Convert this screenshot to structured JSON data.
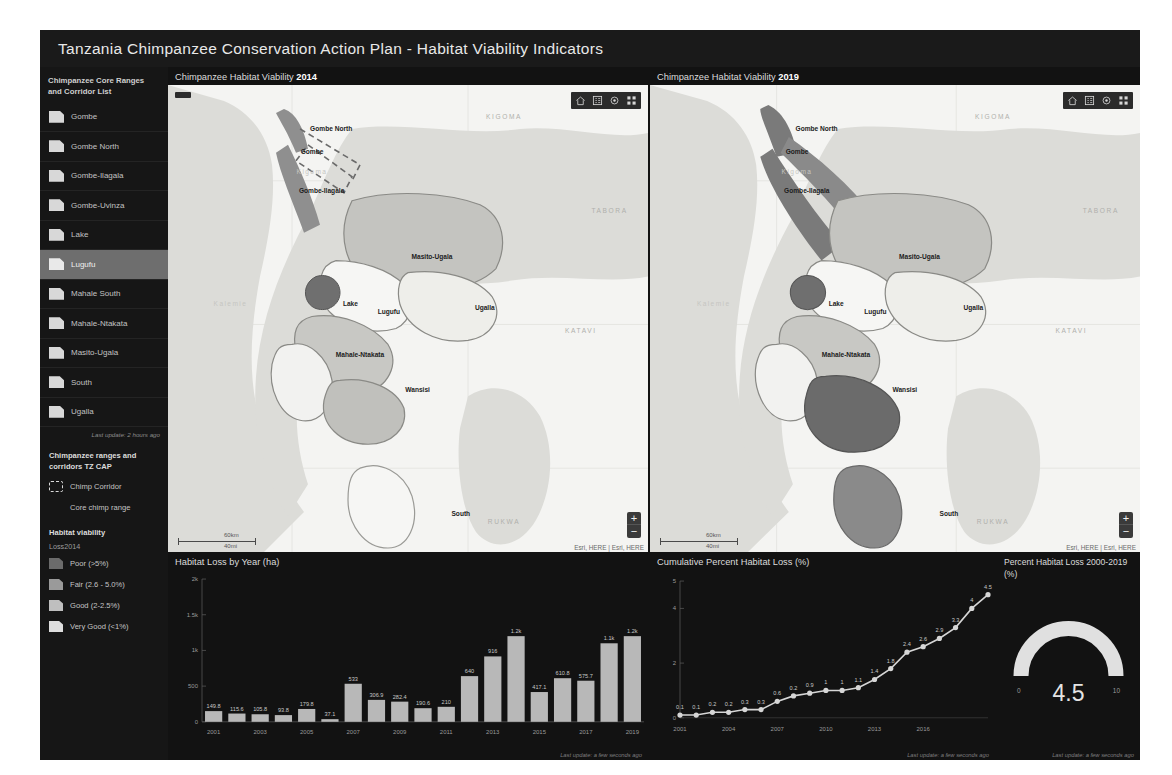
{
  "header": {
    "title": "Tanzania Chimpanzee Conservation Action Plan - Habitat Viability Indicators"
  },
  "sidebar": {
    "list_heading": "Chimpanzee Core Ranges and Corridor List",
    "items": [
      {
        "label": "Gombe",
        "selected": false
      },
      {
        "label": "Gombe North",
        "selected": false
      },
      {
        "label": "Gombe-Ilagala",
        "selected": false
      },
      {
        "label": "Gombe-Uvinza",
        "selected": false
      },
      {
        "label": "Lake",
        "selected": false
      },
      {
        "label": "Lugufu",
        "selected": true
      },
      {
        "label": "Mahale South",
        "selected": false
      },
      {
        "label": "Mahale-Ntakata",
        "selected": false
      },
      {
        "label": "Masito-Ugala",
        "selected": false
      },
      {
        "label": "South",
        "selected": false
      },
      {
        "label": "Ugalla",
        "selected": false
      }
    ],
    "list_update": "Last update: 2 hours ago",
    "legend_heading": "Chimpanzee ranges and corridors TZ CAP",
    "corridor_label": "Chimp Corridor",
    "core_range_label": "Core chimp range",
    "viability_heading": "Habitat viability",
    "viability_sub": "Loss2014",
    "viability_classes": [
      {
        "label": "Poor (>5%)",
        "color": "#6b6b6b"
      },
      {
        "label": "Fair (2.6 - 5.0%)",
        "color": "#9a9a9a"
      },
      {
        "label": "Good (2-2.5%)",
        "color": "#bfbfbf"
      },
      {
        "label": "Very Good (<1%)",
        "color": "#dedede"
      }
    ]
  },
  "maps": {
    "left": {
      "title_prefix": "Chimpanzee Habitat Viability",
      "year": "2014"
    },
    "right": {
      "title_prefix": "Chimpanzee Habitat Viability",
      "year": "2019"
    },
    "scale_km": "60km",
    "scale_mi": "40mi",
    "attribution": "Esri, HERE | Esri, HERE",
    "zoom_in": "+",
    "zoom_out": "−",
    "labels": [
      {
        "text": "Gombe North",
        "x": 34,
        "y": 11,
        "style": "bold"
      },
      {
        "text": "Gombe",
        "x": 30,
        "y": 17,
        "style": "bold"
      },
      {
        "text": "Kigoma",
        "x": 30,
        "y": 22,
        "style": "vfaint"
      },
      {
        "text": "Gombe-Ilagala",
        "x": 32,
        "y": 27,
        "style": "bold"
      },
      {
        "text": "Masito-Ugala",
        "x": 55,
        "y": 44,
        "style": "bold"
      },
      {
        "text": "Lake",
        "x": 38,
        "y": 56,
        "style": "bold"
      },
      {
        "text": "Lugufu",
        "x": 46,
        "y": 58,
        "style": "bold"
      },
      {
        "text": "Ugalla",
        "x": 66,
        "y": 57,
        "style": "bold"
      },
      {
        "text": "Mahale-Ntakata",
        "x": 40,
        "y": 69,
        "style": "bold"
      },
      {
        "text": "Wansisi",
        "x": 52,
        "y": 78,
        "style": "bold"
      },
      {
        "text": "South",
        "x": 61,
        "y": 110,
        "style": "bold"
      },
      {
        "text": "KIGOMA",
        "x": 70,
        "y": 8,
        "style": "faint"
      },
      {
        "text": "TABORA",
        "x": 92,
        "y": 32,
        "style": "faint"
      },
      {
        "text": "KATAVI",
        "x": 86,
        "y": 63,
        "style": "faint"
      },
      {
        "text": "RUKWA",
        "x": 70,
        "y": 112,
        "style": "faint"
      },
      {
        "text": "Kalemie",
        "x": 13,
        "y": 56,
        "style": "vfaint"
      }
    ]
  },
  "chart_data": [
    {
      "type": "bar",
      "title": "Habitat Loss by Year (ha)",
      "xlabel": "",
      "ylabel": "",
      "ylim": [
        0,
        2000
      ],
      "ytick_labels": [
        "0",
        "500",
        "1k",
        "1.5k",
        "2k"
      ],
      "ytick_values": [
        0,
        500,
        1000,
        1500,
        2000
      ],
      "xtick_labels": [
        "2001",
        "2003",
        "2005",
        "2007",
        "2009",
        "2011",
        "2013",
        "2015",
        "2017",
        "2019"
      ],
      "categories": [
        "2001",
        "2002",
        "2003",
        "2004",
        "2005",
        "2006",
        "2007",
        "2008",
        "2009",
        "2010",
        "2011",
        "2012",
        "2013",
        "2014",
        "2015",
        "2016",
        "2017",
        "2018",
        "2019"
      ],
      "values": [
        149.8,
        115.6,
        105.8,
        93.8,
        179.8,
        37.1,
        533,
        306.9,
        282.4,
        190.6,
        210,
        640,
        916,
        1200,
        417.1,
        610.8,
        575.7,
        1100,
        1200
      ],
      "value_labels": [
        "149.8",
        "115.6",
        "105.8",
        "93.8",
        "179.8",
        "37.1",
        "533",
        "306.9",
        "282.4",
        "190.6",
        "210",
        "640",
        "916",
        "1.2k",
        "417.1",
        "610.8",
        "575.7",
        "1.1k",
        "1.2k"
      ],
      "bar_color": "#b8b8b8",
      "update_text": "Last update: a few seconds ago"
    },
    {
      "type": "line",
      "title": "Cumulative Percent Habitat Loss (%)",
      "xlabel": "",
      "ylabel": "",
      "ylim": [
        0,
        5
      ],
      "ytick_labels": [
        "0",
        "2",
        "4",
        "5"
      ],
      "ytick_values": [
        0,
        2,
        4,
        5
      ],
      "xtick_labels": [
        "2001",
        "2004",
        "2007",
        "2010",
        "2013",
        "2016"
      ],
      "x": [
        "2001",
        "2002",
        "2003",
        "2004",
        "2005",
        "2006",
        "2007",
        "2008",
        "2009",
        "2010",
        "2011",
        "2012",
        "2013",
        "2014",
        "2015",
        "2016",
        "2017",
        "2018",
        "2019",
        "2020"
      ],
      "values": [
        0.1,
        0.1,
        0.2,
        0.2,
        0.3,
        0.3,
        0.6,
        0.8,
        0.9,
        1,
        1,
        1.1,
        1.4,
        1.8,
        2.4,
        2.6,
        2.9,
        3.3,
        4,
        4.5
      ],
      "value_labels": [
        "0.1",
        "0.1",
        "0.2",
        "0.2",
        "0.3",
        "0.3",
        "0.6",
        "0.2",
        "0.9",
        "1",
        "1",
        "1.1",
        "1.4",
        "1.8",
        "2.4",
        "2.6",
        "2.9",
        "3.3",
        "4",
        "4.5"
      ],
      "line_color": "#d6d6d6",
      "update_text": "Last update: a few seconds ago"
    },
    {
      "type": "gauge",
      "title": "Percent Habitat Loss 2000-2019 (%)",
      "value": "4.5",
      "min_label": "0",
      "max_label": "10",
      "ylim": [
        0,
        10
      ],
      "arc_color": "#e0e0e0",
      "update_text": "Last update: a few seconds ago"
    }
  ]
}
